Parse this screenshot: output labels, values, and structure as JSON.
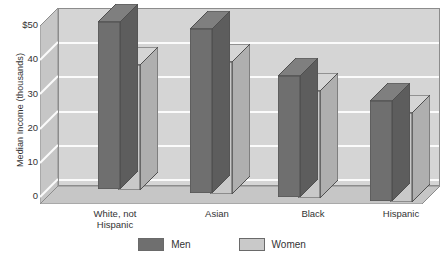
{
  "chart_data": {
    "type": "bar",
    "title": "",
    "subtitle": "",
    "xlabel": "",
    "ylabel": "Median Income (thousands)",
    "categories": [
      "White, not Hispanic",
      "Asian",
      "Black",
      "Hispanic"
    ],
    "category_lines": [
      [
        "White, not",
        "Hispanic"
      ],
      [
        "Asian"
      ],
      [
        "Black"
      ],
      [
        "Hispanic"
      ]
    ],
    "series": [
      {
        "name": "Men",
        "values": [
          47,
          46,
          34,
          28
        ],
        "color": "#6f6f6f"
      },
      {
        "name": "Women",
        "values": [
          35,
          37,
          30,
          25
        ],
        "color": "#c9c9c9"
      }
    ],
    "ylim": [
      0,
      50
    ],
    "yticks": [
      50,
      40,
      30,
      20,
      10,
      0
    ],
    "ytick_labels": [
      "$50",
      "40",
      "30",
      "20",
      "10",
      "0"
    ],
    "grid": true,
    "grid_color": "#fbfbfb",
    "legend_position": "bottom",
    "style": "3d-grouped-bar",
    "plot_background": "#d5d5d5",
    "axis_color": "#8c8c8c"
  },
  "legend": {
    "entries": [
      {
        "label": "Men",
        "color": "#6f6f6f"
      },
      {
        "label": "Women",
        "color": "#c9c9c9"
      }
    ]
  },
  "axis": {
    "y_title": "Median Income (thousands)",
    "y_labels": [
      "$50",
      "40",
      "30",
      "20",
      "10",
      "0"
    ]
  }
}
